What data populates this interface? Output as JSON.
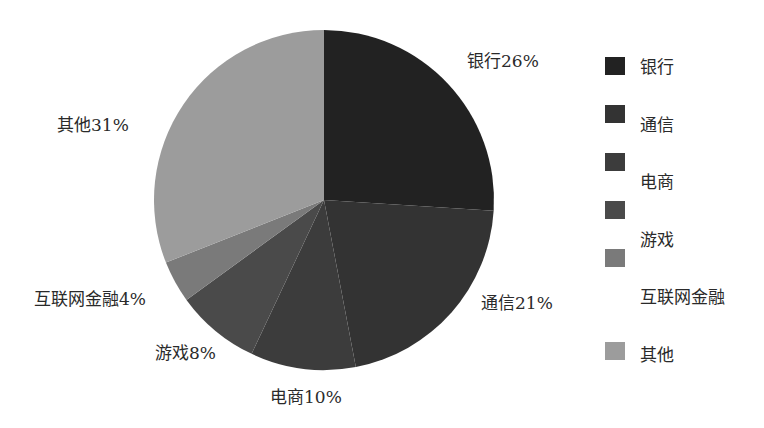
{
  "chart_data": {
    "type": "pie",
    "title": "",
    "categories": [
      "银行",
      "通信",
      "电商",
      "游戏",
      "互联网金融",
      "其他"
    ],
    "values": [
      26,
      21,
      10,
      8,
      4,
      31
    ],
    "unit": "%",
    "labels": [
      "银行26%",
      "通信21%",
      "电商10%",
      "游戏8%",
      "互联网金融4%",
      "其他31%"
    ],
    "colors": [
      "#222222",
      "#333333",
      "#3c3c3c",
      "#4a4a4a",
      "#7a7a7a",
      "#9c9c9c"
    ],
    "start_angle": "12 o'clock",
    "direction": "clockwise",
    "legend_position": "right",
    "legend": [
      "银行",
      "通信",
      "电商",
      "游戏",
      "互联网金融",
      "其他"
    ]
  }
}
